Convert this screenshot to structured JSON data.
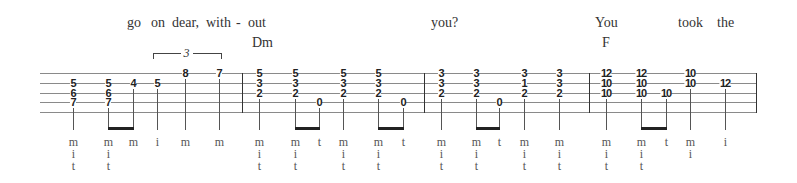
{
  "lyrics": [
    {
      "text": "go",
      "x": 127
    },
    {
      "text": "on",
      "x": 151
    },
    {
      "text": "dear,",
      "x": 172
    },
    {
      "text": "with",
      "x": 206
    },
    {
      "text": "-",
      "x": 236
    },
    {
      "text": "out",
      "x": 248
    },
    {
      "text": "you?",
      "x": 431
    },
    {
      "text": "You",
      "x": 595
    },
    {
      "text": "took",
      "x": 678
    },
    {
      "text": "the",
      "x": 717
    }
  ],
  "chords": [
    {
      "name": "Dm",
      "x": 252
    },
    {
      "name": "F",
      "x": 602
    }
  ],
  "staff": {
    "left": 40,
    "right": 757,
    "lines_y": [
      73,
      83,
      93,
      102,
      112
    ],
    "barlines_x": [
      242,
      424,
      589,
      756
    ]
  },
  "triplet": {
    "label": "3",
    "x1": 153,
    "x2": 220,
    "y": 53
  },
  "notes": [
    {
      "x": 73,
      "frets": [
        "5",
        "6",
        "7"
      ],
      "start_line": 1,
      "fingers": [
        "m",
        "i",
        "t"
      ]
    },
    {
      "x": 108,
      "frets": [
        "5",
        "6",
        "7"
      ],
      "start_line": 1,
      "fingers": [
        "m",
        "i",
        "t"
      ]
    },
    {
      "x": 133,
      "frets": [
        "4"
      ],
      "start_line": 1,
      "fingers": [
        "m"
      ]
    },
    {
      "x": 157,
      "frets": [
        "5"
      ],
      "start_line": 1,
      "fingers": [
        "i"
      ]
    },
    {
      "x": 185,
      "frets": [
        "8"
      ],
      "start_line": 0,
      "fingers": [
        "m"
      ]
    },
    {
      "x": 219,
      "frets": [
        "7"
      ],
      "start_line": 0,
      "fingers": [
        "m"
      ]
    },
    {
      "x": 259,
      "frets": [
        "5",
        "3",
        "2"
      ],
      "start_line": 0,
      "fingers": [
        "m",
        "i",
        "t"
      ]
    },
    {
      "x": 295,
      "frets": [
        "5",
        "3",
        "2"
      ],
      "start_line": 0,
      "fingers": [
        "m",
        "i",
        "t"
      ]
    },
    {
      "x": 319,
      "frets": [
        "0"
      ],
      "start_line": 3,
      "fingers": [
        "t"
      ]
    },
    {
      "x": 343,
      "frets": [
        "5",
        "3",
        "2"
      ],
      "start_line": 0,
      "fingers": [
        "m",
        "i",
        "t"
      ]
    },
    {
      "x": 378,
      "frets": [
        "5",
        "3",
        "2"
      ],
      "start_line": 0,
      "fingers": [
        "m",
        "i",
        "t"
      ]
    },
    {
      "x": 403,
      "frets": [
        "0"
      ],
      "start_line": 3,
      "fingers": [
        "t"
      ]
    },
    {
      "x": 441,
      "frets": [
        "3",
        "3",
        "2"
      ],
      "start_line": 0,
      "fingers": [
        "m",
        "i",
        "t"
      ]
    },
    {
      "x": 476,
      "frets": [
        "3",
        "3",
        "2"
      ],
      "start_line": 0,
      "fingers": [
        "m",
        "i",
        "t"
      ]
    },
    {
      "x": 499,
      "frets": [
        "0"
      ],
      "start_line": 3,
      "fingers": [
        "t"
      ]
    },
    {
      "x": 524,
      "frets": [
        "3",
        "1",
        "2"
      ],
      "start_line": 0,
      "fingers": [
        "m",
        "i",
        "t"
      ]
    },
    {
      "x": 559,
      "frets": [
        "3",
        "3",
        "2"
      ],
      "start_line": 0,
      "fingers": [
        "m",
        "i",
        "t"
      ]
    },
    {
      "x": 606,
      "frets": [
        "12",
        "10",
        "10"
      ],
      "start_line": 0,
      "fingers": [
        "m",
        "i",
        "t"
      ]
    },
    {
      "x": 641,
      "frets": [
        "12",
        "10",
        "10"
      ],
      "start_line": 0,
      "fingers": [
        "m",
        "i",
        "t"
      ]
    },
    {
      "x": 666,
      "frets": [
        "10"
      ],
      "start_line": 2,
      "fingers": [
        "t"
      ]
    },
    {
      "x": 690,
      "frets": [
        "10",
        "10"
      ],
      "start_line": 0,
      "fingers": [
        "m",
        "i"
      ]
    },
    {
      "x": 725,
      "frets": [
        "12"
      ],
      "start_line": 1,
      "fingers": [
        "i"
      ]
    }
  ],
  "beams": [
    {
      "from": 1,
      "to": 2
    },
    {
      "from": 7,
      "to": 8
    },
    {
      "from": 10,
      "to": 11
    },
    {
      "from": 13,
      "to": 14
    },
    {
      "from": 18,
      "to": 19
    }
  ],
  "layout": {
    "stem_bottom": 130,
    "finger_row_y": [
      136,
      148,
      160
    ]
  }
}
